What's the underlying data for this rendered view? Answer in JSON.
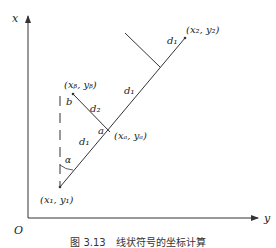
{
  "axes": {
    "x_label": "x",
    "y_label": "y",
    "origin_label": "O"
  },
  "points": {
    "p1": "(x₁, y₁)",
    "p2": "(x₂, y₂)",
    "pa": "(xₐ, yₐ)",
    "pb": "(xᵦ, yᵦ)"
  },
  "labels": {
    "d1_lower": "d₁",
    "d1_upper": "d₁",
    "d1_top": "d₁",
    "d2": "d₂",
    "a": "a",
    "b": "b",
    "alpha": "α"
  },
  "caption": "图 3.13　线状符号的坐标计算"
}
